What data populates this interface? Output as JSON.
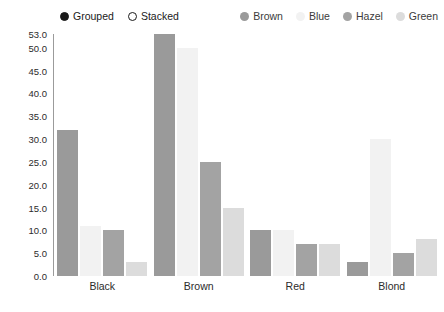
{
  "mode_legend": {
    "options": [
      {
        "label": "Grouped",
        "selected": true
      },
      {
        "label": "Stacked",
        "selected": false
      }
    ]
  },
  "chart_data": {
    "type": "bar",
    "title": "",
    "subtitle": "",
    "xlabel": "",
    "ylabel": "",
    "grid": false,
    "legend_position": "top-right",
    "barmode": "grouped",
    "categories": [
      "Black",
      "Brown",
      "Red",
      "Blond"
    ],
    "series": [
      {
        "name": "Brown",
        "color": "#9a9a9a",
        "values": [
          32,
          53,
          10,
          3
        ]
      },
      {
        "name": "Blue",
        "color": "#f2f2f2",
        "values": [
          11,
          50,
          10,
          30
        ]
      },
      {
        "name": "Hazel",
        "color": "#a3a3a3",
        "values": [
          10,
          25,
          7,
          5
        ]
      },
      {
        "name": "Green",
        "color": "#dcdcdc",
        "values": [
          3,
          15,
          7,
          8
        ]
      }
    ],
    "ylim": [
      0,
      53
    ],
    "yticks": [
      0,
      5,
      10,
      15,
      20,
      25,
      30,
      35,
      40,
      45,
      50,
      53
    ],
    "ytick_labels": [
      "0.0",
      "5.0",
      "10.0",
      "15.0",
      "20.0",
      "25.0",
      "30.0",
      "35.0",
      "40.0",
      "45.0",
      "50.0",
      "53.0"
    ]
  }
}
